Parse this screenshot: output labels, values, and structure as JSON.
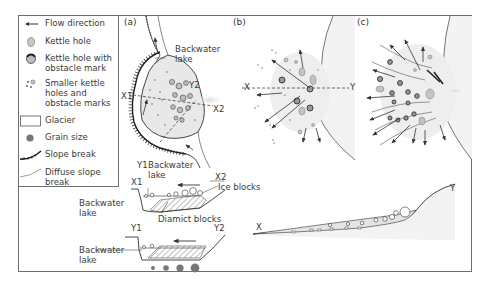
{
  "legend": {
    "items": [
      {
        "symbol": "flow-direction-arrow",
        "label": "Flow direction"
      },
      {
        "symbol": "kettle-hole",
        "label": "Kettle hole"
      },
      {
        "symbol": "kettle-hole-obstacle",
        "label": "Kettle hole with obstacle mark"
      },
      {
        "symbol": "small-kettle-dots",
        "label": "Smaller kettle holes and obstacle marks"
      },
      {
        "symbol": "glacier-box",
        "label": "Glacier"
      },
      {
        "symbol": "grain-size-dot",
        "label": "Grain size"
      },
      {
        "symbol": "slope-break",
        "label": "Slope break"
      },
      {
        "symbol": "diffuse-slope-break",
        "label": "Diffuse slope break"
      }
    ],
    "item_lines": {
      "flow": [
        "Flow direction"
      ],
      "kettle": [
        "Kettle hole"
      ],
      "kettle_obstacle": [
        "Kettle hole with",
        "obstacle mark"
      ],
      "smaller": [
        "Smaller kettle",
        "holes and",
        "obstacle marks"
      ],
      "glacier": [
        "Glacier"
      ],
      "grain": [
        "Grain size"
      ],
      "slope": [
        "Slope break"
      ],
      "diffuse": [
        "Diffuse slope break"
      ]
    }
  },
  "panels": {
    "a": {
      "label": "(a)",
      "backwater_lake": [
        "Backwater",
        "lake"
      ],
      "section_markers": {
        "x1": "X1",
        "x2": "X2",
        "y1": "Y1",
        "y2": "Y2"
      }
    },
    "b": {
      "label": "(b)",
      "section_markers": {
        "x": "X",
        "y": "Y"
      }
    },
    "c": {
      "label": "(c)"
    }
  },
  "cross_sections": {
    "x1x2": {
      "start": "X1",
      "end": "X2",
      "labels": {
        "backwater_lake": [
          "Backwater",
          "lake"
        ],
        "ice_blocks": "Ice blocks",
        "diamict_blocks": "Diamict blocks"
      },
      "side_label": [
        "Backwater",
        "lake"
      ]
    },
    "y1y2": {
      "start": "Y1",
      "end": "Y2",
      "side_label": [
        "Backwater",
        "lake"
      ],
      "grain_sizes": 4
    },
    "xy": {
      "start": "X",
      "end": "Y"
    }
  },
  "colors": {
    "frame": "#6e6e6e",
    "ink": "#3a3a3a",
    "glacier_fill": "#f2f2f2",
    "sediment_fill": "#e6e6e6",
    "kettle_fill": "#c6c6c6",
    "grain_fill": "#777777"
  }
}
